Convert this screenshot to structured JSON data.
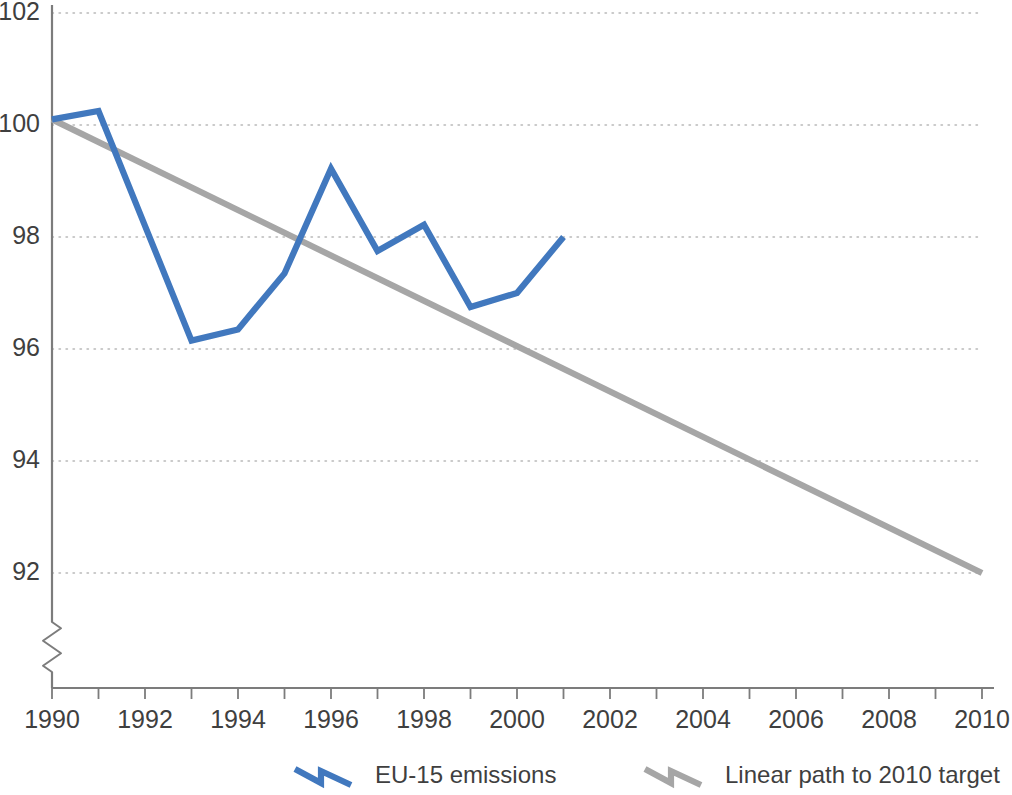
{
  "chart_data": {
    "type": "line",
    "title": "",
    "subtitle": "",
    "xlabel": "",
    "ylabel": "",
    "xlim": [
      1990,
      2010
    ],
    "ylim": [
      91.2,
      102
    ],
    "y_axis_break": true,
    "grid": true,
    "grid_axis": "y",
    "legend_position": "bottom",
    "x_tick_labels": [
      "1990",
      "1992",
      "1994",
      "1996",
      "1998",
      "2000",
      "2002",
      "2004",
      "2006",
      "2008",
      "2010"
    ],
    "x_tick_values": [
      1990,
      1992,
      1994,
      1996,
      1998,
      2000,
      2002,
      2004,
      2006,
      2008,
      2010
    ],
    "x_minor_tick_values": [
      1991,
      1993,
      1995,
      1997,
      1999,
      2001,
      2003,
      2005,
      2007,
      2009
    ],
    "y_tick_labels": [
      "92",
      "94",
      "96",
      "98",
      "100",
      "102"
    ],
    "y_tick_values": [
      92,
      94,
      96,
      98,
      100,
      102
    ],
    "series": [
      {
        "name": "EU-15 emissions",
        "color": "#4178be",
        "x": [
          1990,
          1991,
          1992,
          1993,
          1994,
          1995,
          1996,
          1997,
          1998,
          1999,
          2000,
          2001
        ],
        "values": [
          100.1,
          100.25,
          98.2,
          96.15,
          96.35,
          97.35,
          99.22,
          97.75,
          98.22,
          96.75,
          97.0,
          98.0
        ]
      },
      {
        "name": "Linear path to 2010 target",
        "color": "#a6a6a6",
        "x": [
          1990,
          2010
        ],
        "values": [
          100.1,
          92.0
        ]
      }
    ]
  },
  "legend": {
    "items": [
      {
        "label": "EU-15 emissions",
        "color": "#4178be"
      },
      {
        "label": "Linear path to 2010 target",
        "color": "#a6a6a6"
      }
    ]
  },
  "colors": {
    "emissions_blue": "#4178be",
    "target_gray": "#a6a6a6",
    "axis_gray": "#7c7c7c",
    "grid_gray": "#b9b9b9",
    "text_gray": "#3f3f3f",
    "background": "#ffffff"
  }
}
